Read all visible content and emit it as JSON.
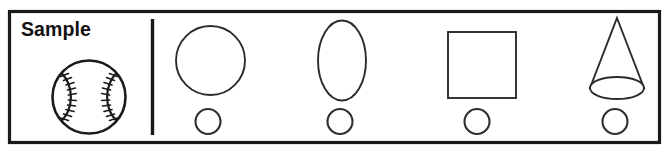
{
  "worksheet": {
    "label": "Sample",
    "border_color": "#1a1a1a",
    "shape_stroke_color": "#2b2b2b",
    "background_color": "#ffffff",
    "sample_panel": {
      "title": "Sample",
      "shape_name": "baseball",
      "shape_description": "baseball with two curved seams and stitches"
    },
    "divider": {
      "name": "vertical-divider"
    },
    "columns": [
      {
        "index": 1,
        "main_shape": "circle",
        "main_shape_label": "circle",
        "answer_shape": "circle",
        "answer_shape_label": "small circle"
      },
      {
        "index": 2,
        "main_shape": "ellipse",
        "main_shape_label": "ellipse",
        "answer_shape": "circle",
        "answer_shape_label": "small circle"
      },
      {
        "index": 3,
        "main_shape": "square",
        "main_shape_label": "square",
        "answer_shape": "circle",
        "answer_shape_label": "small circle"
      },
      {
        "index": 4,
        "main_shape": "cone",
        "main_shape_label": "cone",
        "answer_shape": "circle",
        "answer_shape_label": "small circle"
      }
    ]
  }
}
